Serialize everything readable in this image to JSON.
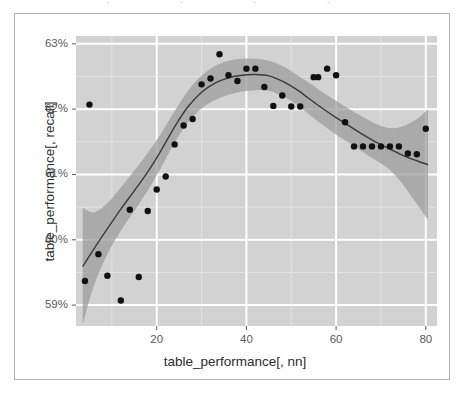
{
  "figure": {
    "top_artifact_text": "· · · ·",
    "border_color": "#aeb0b5",
    "background": "#ffffff"
  },
  "panel": {
    "fill": "#d2d2d2",
    "major_gridline_color": "#ffffff",
    "minor_gridline_color": "#e2e2e2",
    "x_px": [
      76,
      437
    ],
    "y_px": [
      36,
      326
    ]
  },
  "style": {
    "point_color": "#111111",
    "point_radius": 3.2,
    "line_color": "#3a3a3a",
    "ribbon_color": "#9a9a9a",
    "ribbon_opacity": 0.72,
    "tick_color": "#5a5a5e",
    "axis_text_color": "#2b2b2b"
  },
  "chart_data": {
    "type": "scatter",
    "title": "",
    "subtitle": "",
    "xlabel": "table_performance[, nn]",
    "ylabel": "table_performance[, recall]",
    "xlim": [
      2.0,
      82.5
    ],
    "ylim": [
      58.68,
      63.12
    ],
    "xticks": [
      20,
      40,
      60,
      80
    ],
    "xtick_labels": [
      "20",
      "40",
      "60",
      "80"
    ],
    "yticks": [
      59,
      60,
      61,
      62,
      63
    ],
    "ytick_labels": [
      "59%",
      "60%",
      "61%",
      "62%",
      "63%"
    ],
    "x_minor_ticks": [
      10,
      30,
      50,
      70
    ],
    "y_minor_ticks": [
      59.5,
      60.5,
      61.5,
      62.5
    ],
    "grid": true,
    "legend": "none",
    "annotations": [],
    "series": [
      {
        "name": "observations",
        "type": "scatter",
        "marker": "filled-circle",
        "points": [
          {
            "x": 4,
            "y": 59.37
          },
          {
            "x": 5,
            "y": 62.07
          },
          {
            "x": 7,
            "y": 59.78
          },
          {
            "x": 9,
            "y": 59.45
          },
          {
            "x": 12,
            "y": 59.07
          },
          {
            "x": 14,
            "y": 60.46
          },
          {
            "x": 16,
            "y": 59.43
          },
          {
            "x": 18,
            "y": 60.44
          },
          {
            "x": 20,
            "y": 60.77
          },
          {
            "x": 22,
            "y": 60.97
          },
          {
            "x": 24,
            "y": 61.46
          },
          {
            "x": 26,
            "y": 61.75
          },
          {
            "x": 28,
            "y": 61.85
          },
          {
            "x": 30,
            "y": 62.38
          },
          {
            "x": 32,
            "y": 62.47
          },
          {
            "x": 34,
            "y": 62.84
          },
          {
            "x": 36,
            "y": 62.52
          },
          {
            "x": 38,
            "y": 62.43
          },
          {
            "x": 40,
            "y": 62.62
          },
          {
            "x": 42,
            "y": 62.62
          },
          {
            "x": 44,
            "y": 62.34
          },
          {
            "x": 46,
            "y": 62.05
          },
          {
            "x": 48,
            "y": 62.21
          },
          {
            "x": 50,
            "y": 62.04
          },
          {
            "x": 52,
            "y": 62.04
          },
          {
            "x": 55,
            "y": 62.49
          },
          {
            "x": 56,
            "y": 62.49
          },
          {
            "x": 58,
            "y": 62.62
          },
          {
            "x": 60,
            "y": 62.52
          },
          {
            "x": 62,
            "y": 61.8
          },
          {
            "x": 64,
            "y": 61.43
          },
          {
            "x": 66,
            "y": 61.43
          },
          {
            "x": 68,
            "y": 61.43
          },
          {
            "x": 70,
            "y": 61.43
          },
          {
            "x": 72,
            "y": 61.43
          },
          {
            "x": 74,
            "y": 61.43
          },
          {
            "x": 76,
            "y": 61.32
          },
          {
            "x": 78,
            "y": 61.31
          },
          {
            "x": 80,
            "y": 61.7
          }
        ]
      },
      {
        "name": "loess-smooth",
        "type": "line",
        "points": [
          {
            "x": 3.5,
            "y": 59.59
          },
          {
            "x": 6,
            "y": 59.86
          },
          {
            "x": 9,
            "y": 60.17
          },
          {
            "x": 12,
            "y": 60.47
          },
          {
            "x": 15,
            "y": 60.75
          },
          {
            "x": 18,
            "y": 61.04
          },
          {
            "x": 21,
            "y": 61.37
          },
          {
            "x": 24,
            "y": 61.73
          },
          {
            "x": 27,
            "y": 62.04
          },
          {
            "x": 30,
            "y": 62.26
          },
          {
            "x": 33,
            "y": 62.4
          },
          {
            "x": 36,
            "y": 62.48
          },
          {
            "x": 39,
            "y": 62.52
          },
          {
            "x": 42,
            "y": 62.53
          },
          {
            "x": 45,
            "y": 62.51
          },
          {
            "x": 48,
            "y": 62.43
          },
          {
            "x": 51,
            "y": 62.31
          },
          {
            "x": 54,
            "y": 62.16
          },
          {
            "x": 57,
            "y": 62.01
          },
          {
            "x": 60,
            "y": 61.87
          },
          {
            "x": 63,
            "y": 61.74
          },
          {
            "x": 66,
            "y": 61.61
          },
          {
            "x": 69,
            "y": 61.49
          },
          {
            "x": 72,
            "y": 61.39
          },
          {
            "x": 75,
            "y": 61.29
          },
          {
            "x": 78,
            "y": 61.21
          },
          {
            "x": 80.5,
            "y": 61.15
          }
        ]
      },
      {
        "name": "confidence-ribbon",
        "type": "band",
        "upper": [
          {
            "x": 3.5,
            "y": 60.49
          },
          {
            "x": 6,
            "y": 60.42
          },
          {
            "x": 9,
            "y": 60.56
          },
          {
            "x": 12,
            "y": 60.8
          },
          {
            "x": 15,
            "y": 61.06
          },
          {
            "x": 18,
            "y": 61.33
          },
          {
            "x": 21,
            "y": 61.63
          },
          {
            "x": 24,
            "y": 61.97
          },
          {
            "x": 27,
            "y": 62.28
          },
          {
            "x": 30,
            "y": 62.51
          },
          {
            "x": 33,
            "y": 62.66
          },
          {
            "x": 36,
            "y": 62.74
          },
          {
            "x": 39,
            "y": 62.77
          },
          {
            "x": 42,
            "y": 62.77
          },
          {
            "x": 45,
            "y": 62.74
          },
          {
            "x": 48,
            "y": 62.66
          },
          {
            "x": 51,
            "y": 62.54
          },
          {
            "x": 54,
            "y": 62.4
          },
          {
            "x": 57,
            "y": 62.26
          },
          {
            "x": 60,
            "y": 62.13
          },
          {
            "x": 63,
            "y": 62.0
          },
          {
            "x": 66,
            "y": 61.88
          },
          {
            "x": 69,
            "y": 61.77
          },
          {
            "x": 72,
            "y": 61.71
          },
          {
            "x": 75,
            "y": 61.74
          },
          {
            "x": 78,
            "y": 61.85
          },
          {
            "x": 80.5,
            "y": 62.0
          }
        ],
        "lower": [
          {
            "x": 3.5,
            "y": 58.7
          },
          {
            "x": 6,
            "y": 59.3
          },
          {
            "x": 9,
            "y": 59.78
          },
          {
            "x": 12,
            "y": 60.14
          },
          {
            "x": 15,
            "y": 60.44
          },
          {
            "x": 18,
            "y": 60.75
          },
          {
            "x": 21,
            "y": 61.11
          },
          {
            "x": 24,
            "y": 61.49
          },
          {
            "x": 27,
            "y": 61.8
          },
          {
            "x": 30,
            "y": 62.01
          },
          {
            "x": 33,
            "y": 62.14
          },
          {
            "x": 36,
            "y": 62.22
          },
          {
            "x": 39,
            "y": 62.27
          },
          {
            "x": 42,
            "y": 62.29
          },
          {
            "x": 45,
            "y": 62.28
          },
          {
            "x": 48,
            "y": 62.2
          },
          {
            "x": 51,
            "y": 62.08
          },
          {
            "x": 54,
            "y": 61.92
          },
          {
            "x": 57,
            "y": 61.76
          },
          {
            "x": 60,
            "y": 61.61
          },
          {
            "x": 63,
            "y": 61.48
          },
          {
            "x": 66,
            "y": 61.34
          },
          {
            "x": 69,
            "y": 61.21
          },
          {
            "x": 72,
            "y": 61.07
          },
          {
            "x": 75,
            "y": 60.84
          },
          {
            "x": 78,
            "y": 60.55
          },
          {
            "x": 80.5,
            "y": 60.3
          }
        ]
      }
    ]
  }
}
